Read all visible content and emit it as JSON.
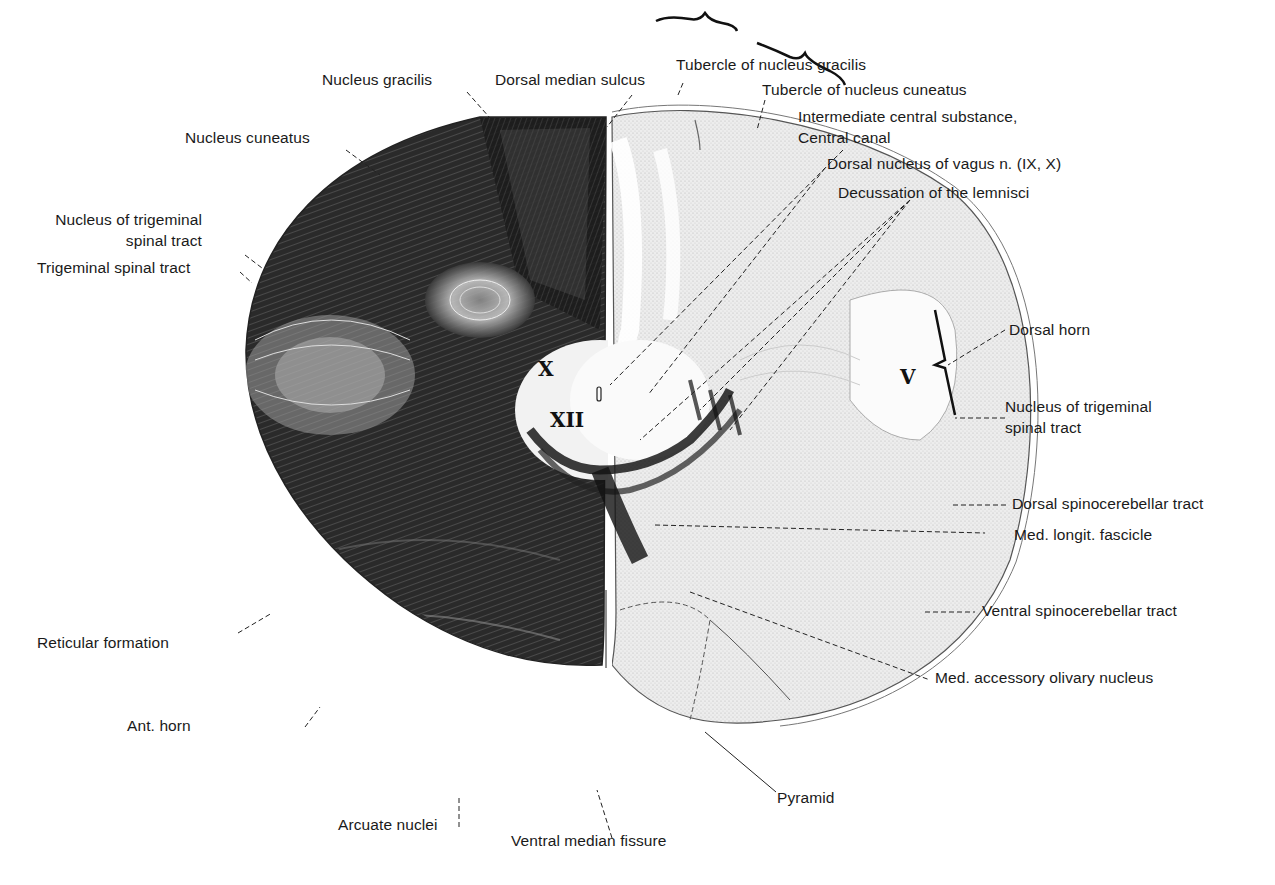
{
  "figure": {
    "left_half_stain": "dark (myelin stain)",
    "right_half_stain": "light (cell stain)"
  },
  "labels": {
    "nucleus_gracilis": "Nucleus gracilis",
    "dorsal_median_sulcus": "Dorsal median sulcus",
    "tubercle_gracilis": "Tubercle of nucleus gracilis",
    "tubercle_cuneatus": "Tubercle of nucleus cuneatus",
    "intermediate_central_1": "Intermediate central substance,",
    "intermediate_central_2": "Central canal",
    "dorsal_nucleus_vagus": "Dorsal nucleus of vagus n. (IX, X)",
    "decussation_lemnisci": "Decussation of the lemnisci",
    "nucleus_cuneatus": "Nucleus cuneatus",
    "nucleus_trig_left_1": "Nucleus of trigeminal",
    "nucleus_trig_left_2": "spinal tract",
    "trigeminal_spinal_tract": "Trigeminal spinal tract",
    "dorsal_horn": "Dorsal horn",
    "nucleus_trig_right_1": "Nucleus of trigeminal",
    "nucleus_trig_right_2": "spinal tract",
    "dorsal_spinocerebellar": "Dorsal spinocerebellar tract",
    "med_longit_fascicle": "Med. longit. fascicle",
    "ventral_spinocerebellar": "Ventral spinocerebellar tract",
    "med_accessory_olivary": "Med. accessory olivary nucleus",
    "reticular_formation": "Reticular formation",
    "ant_horn": "Ant. horn",
    "arcuate_nuclei": "Arcuate nuclei",
    "ventral_median_fissure": "Ventral median fissure",
    "pyramid": "Pyramid"
  },
  "roman_numerals": {
    "x": "X",
    "xii": "XII",
    "v": "V"
  }
}
